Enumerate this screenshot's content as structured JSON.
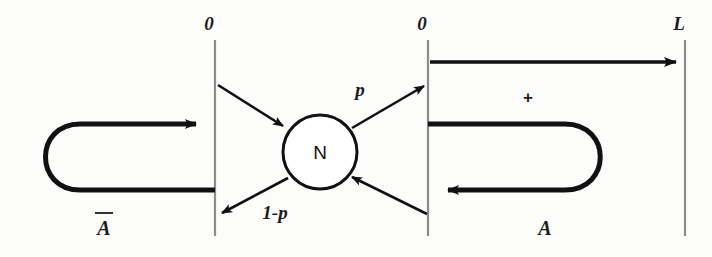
{
  "figure": {
    "background_color": "#fcfcfb",
    "stroke_color": "#111111",
    "boundaries": [
      {
        "id": "left-boundary",
        "top_label": "0",
        "x": 215,
        "y1": 40,
        "y2": 236
      },
      {
        "id": "middle-boundary",
        "top_label": "0",
        "x": 428,
        "y1": 40,
        "y2": 236
      },
      {
        "id": "right-boundary",
        "top_label": "L",
        "x": 685,
        "y1": 40,
        "y2": 236
      }
    ],
    "node": {
      "label": "N",
      "cx": 320,
      "cy": 152,
      "r": 37
    },
    "edge_labels": {
      "branch_p": "p",
      "branch_1_minus_p": "1-p",
      "plus": "+"
    },
    "region_labels": {
      "left": "A",
      "left_overbar": true,
      "right": "A",
      "right_overbar": false
    },
    "top_axis_label": "L",
    "zero_label": "0"
  }
}
